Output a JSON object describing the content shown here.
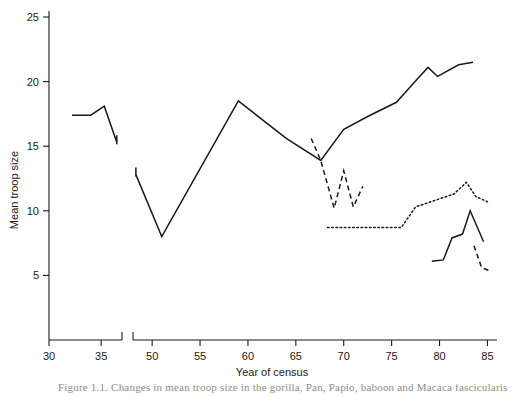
{
  "figure": {
    "caption_partial": "Figure 1.1. Changes in mean troop size in the gorilla, Pan, Papio, baboon and Macaca fascicularis"
  },
  "chart_data": {
    "type": "line",
    "title": "",
    "xlabel": "Year of census",
    "ylabel": "Mean troop size",
    "xlim": [
      30,
      86
    ],
    "ylim": [
      0,
      26
    ],
    "yticks": [
      5,
      10,
      15,
      20,
      25
    ],
    "ytick_labels": [
      "5",
      "10",
      "15",
      "20",
      "25"
    ],
    "xticks": [
      30,
      35,
      50,
      55,
      60,
      65,
      70,
      75,
      80,
      85
    ],
    "xtick_labels": [
      "30",
      "35",
      "50",
      "55",
      "60",
      "65",
      "70",
      "75",
      "80",
      "85"
    ],
    "axis_break": {
      "present": true,
      "between": [
        37,
        48
      ],
      "axis": "x"
    },
    "grid": false,
    "legend": "none",
    "series": [
      {
        "name": "early-census-solid",
        "style": "solid",
        "points": [
          {
            "x": 32.2,
            "y": 17.4
          },
          {
            "x": 34.0,
            "y": 17.4
          },
          {
            "x": 35.3,
            "y": 18.1
          },
          {
            "x": 36.5,
            "y": 15.3
          }
        ]
      },
      {
        "name": "main-census-solid",
        "style": "solid",
        "points": [
          {
            "x": 48.3,
            "y": 12.8
          },
          {
            "x": 51.0,
            "y": 8.0
          },
          {
            "x": 59.0,
            "y": 18.5
          },
          {
            "x": 64.0,
            "y": 15.6
          },
          {
            "x": 67.6,
            "y": 13.9
          },
          {
            "x": 70.0,
            "y": 16.3
          },
          {
            "x": 72.5,
            "y": 17.3
          },
          {
            "x": 75.5,
            "y": 18.4
          },
          {
            "x": 77.8,
            "y": 20.3
          },
          {
            "x": 78.8,
            "y": 21.1
          },
          {
            "x": 79.8,
            "y": 20.4
          },
          {
            "x": 82.0,
            "y": 21.3
          },
          {
            "x": 83.5,
            "y": 21.5
          }
        ]
      },
      {
        "name": "dashed-census-mid",
        "style": "dashed",
        "points": [
          {
            "x": 66.6,
            "y": 15.6
          },
          {
            "x": 67.6,
            "y": 13.9
          },
          {
            "x": 69.0,
            "y": 10.2
          },
          {
            "x": 70.0,
            "y": 13.1
          },
          {
            "x": 71.0,
            "y": 10.3
          },
          {
            "x": 72.0,
            "y": 11.9
          }
        ]
      },
      {
        "name": "dotted-census-low",
        "style": "dotted",
        "points": [
          {
            "x": 68.3,
            "y": 8.7
          },
          {
            "x": 76.0,
            "y": 8.7
          },
          {
            "x": 77.5,
            "y": 10.3
          },
          {
            "x": 79.5,
            "y": 10.8
          },
          {
            "x": 81.5,
            "y": 11.3
          },
          {
            "x": 82.8,
            "y": 12.2
          },
          {
            "x": 83.8,
            "y": 11.1
          },
          {
            "x": 85.0,
            "y": 10.7
          }
        ]
      },
      {
        "name": "solid-census-lower-right",
        "style": "solid",
        "points": [
          {
            "x": 79.2,
            "y": 6.1
          },
          {
            "x": 80.4,
            "y": 6.2
          },
          {
            "x": 81.3,
            "y": 7.9
          },
          {
            "x": 82.4,
            "y": 8.2
          },
          {
            "x": 83.2,
            "y": 10.0
          },
          {
            "x": 84.6,
            "y": 7.6
          }
        ]
      },
      {
        "name": "dashed-census-bottom-right",
        "style": "dashed",
        "points": [
          {
            "x": 83.6,
            "y": 7.3
          },
          {
            "x": 84.4,
            "y": 5.6
          },
          {
            "x": 85.1,
            "y": 5.4
          }
        ]
      }
    ]
  }
}
